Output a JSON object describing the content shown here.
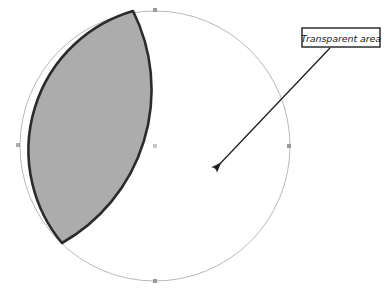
{
  "figure": {
    "name": "transparent-area-diagram",
    "background_color": "#ffffff",
    "callout": {
      "label": "Transparent area",
      "box": {
        "x": 302,
        "y": 28,
        "width": 78,
        "height": 19,
        "fill_color": "#ffffff",
        "border_color": "#1f1f1f",
        "border_width": 1.4
      },
      "leader_line": {
        "from_x": 330,
        "from_y": 48,
        "to_x": 212,
        "to_y": 172,
        "color": "#1f1f1f",
        "width": 1.3,
        "arrowhead": "solid-triangle"
      }
    },
    "circle_outline": {
      "name": "transparent-circle",
      "center_x": 155,
      "center_y": 146,
      "radius": 135,
      "stroke_color": "#b9b9b9",
      "stroke_width": 1,
      "fill": "none"
    },
    "lens_shape": {
      "name": "shaded-lens-area",
      "fill_color": "#acacac",
      "stroke_color": "#2b2b2b",
      "stroke_width": 2.6,
      "top_vertex_x": 133,
      "top_vertex_y": 11,
      "bottom_vertex_x": 62,
      "bottom_vertex_y": 243,
      "right_extent_x": 172,
      "left_extent_x": 12
    },
    "anchor_points": [
      {
        "name": "anchor-circle-top",
        "x": 155,
        "y": 10,
        "color": "#9a9a9a"
      },
      {
        "name": "anchor-circle-right",
        "x": 289,
        "y": 146,
        "color": "#9a9a9a"
      },
      {
        "name": "anchor-circle-bottom",
        "x": 155,
        "y": 281,
        "color": "#9a9a9a"
      },
      {
        "name": "anchor-circle-left",
        "x": 18,
        "y": 145,
        "color": "#9a9a9a"
      },
      {
        "name": "anchor-circle-center",
        "x": 155,
        "y": 146,
        "color": "#9a9a9a"
      }
    ]
  }
}
